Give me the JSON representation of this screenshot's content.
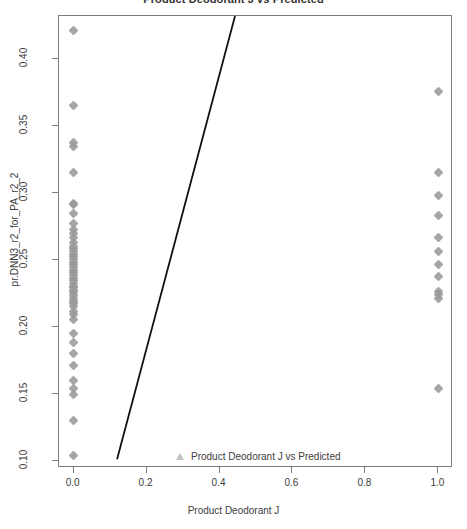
{
  "chart_data": {
    "type": "scatter",
    "title": "Product Deodorant J vs Predicted",
    "xlabel": "Product Deodorant J",
    "ylabel": "pr.DNN3_r2_for_PA_r2_2",
    "xlim": [
      -0.04,
      1.04
    ],
    "ylim": [
      0.095,
      0.432
    ],
    "grid": false,
    "legend": {
      "position": "bottom-center-inside",
      "entries": [
        {
          "label": "Product Deodorant J vs Predicted",
          "marker": "triangle",
          "color": "#c2c2c2"
        }
      ]
    },
    "xticks": [
      0.0,
      0.2,
      0.4,
      0.6,
      0.8,
      1.0
    ],
    "xtick_labels": [
      "0.0",
      "0.2",
      "0.4",
      "0.6",
      "0.8",
      "1.0"
    ],
    "yticks": [
      0.1,
      0.15,
      0.2,
      0.25,
      0.3,
      0.35,
      0.4
    ],
    "ytick_labels": [
      "0.10",
      "0.15",
      "0.20",
      "0.25",
      "0.30",
      "0.35",
      "0.40"
    ],
    "point_color": "#9a9a9a",
    "point_marker": "diamond",
    "series": [
      {
        "name": "Product Deodorant J vs Predicted",
        "x": [
          0,
          0,
          0,
          0,
          0,
          0,
          0,
          0,
          0,
          0,
          0,
          0,
          0,
          0,
          0,
          0,
          0,
          0,
          0,
          0,
          0,
          0,
          0,
          0,
          0,
          0,
          0,
          0,
          0,
          0,
          0,
          0,
          0,
          0,
          0,
          0,
          0,
          0,
          0,
          0,
          0,
          0,
          0,
          0,
          0,
          0,
          0,
          0,
          0,
          1,
          1,
          1,
          1,
          1,
          1,
          1,
          1,
          1,
          1,
          1,
          1
        ],
        "y": [
          0.4215,
          0.3655,
          0.3375,
          0.3345,
          0.3155,
          0.2925,
          0.2915,
          0.2845,
          0.2775,
          0.2725,
          0.2695,
          0.2665,
          0.2635,
          0.2605,
          0.2585,
          0.2565,
          0.2545,
          0.2525,
          0.2505,
          0.2485,
          0.2465,
          0.2445,
          0.2425,
          0.2405,
          0.2385,
          0.2365,
          0.2345,
          0.2325,
          0.2305,
          0.2295,
          0.2275,
          0.2255,
          0.2235,
          0.2215,
          0.2195,
          0.2175,
          0.2155,
          0.2115,
          0.2095,
          0.2055,
          0.1955,
          0.1885,
          0.1805,
          0.1715,
          0.1605,
          0.1545,
          0.1495,
          0.1305,
          0.1045,
          0.3755,
          0.3155,
          0.2985,
          0.2835,
          0.2665,
          0.2565,
          0.2465,
          0.2375,
          0.2265,
          0.2245,
          0.2215,
          0.1545
        ]
      }
    ],
    "fit_line": {
      "label": "regression-line",
      "color": "#111111",
      "width": 1.8,
      "x_start": 0.12,
      "y_start": 0.1,
      "x_end": 0.445,
      "y_end": 0.432
    }
  }
}
